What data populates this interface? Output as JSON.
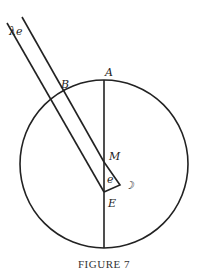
{
  "figure": {
    "caption": "FIGURE 7",
    "labels": {
      "A": "A",
      "B": "B",
      "M": "M",
      "E": "E",
      "e": "e",
      "lambda_e": "λe",
      "moon": "☽"
    }
  }
}
